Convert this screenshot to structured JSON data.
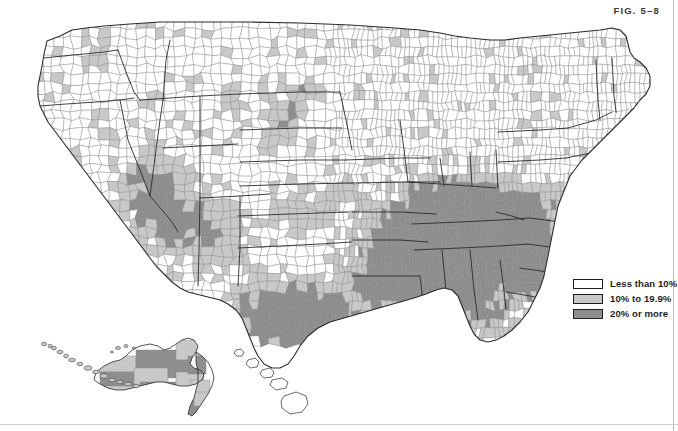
{
  "figure": {
    "label_prefix": "F",
    "label_small": "IG",
    "label_number": ". 5–8",
    "label_full": "FIG. 5–8",
    "clipped_top_text": ""
  },
  "legend": {
    "title": "",
    "items": [
      {
        "label": "Less than 10%",
        "color": "#ffffff",
        "swatch_name": "legend-swatch-less-than-10"
      },
      {
        "label": "10% to 19.9%",
        "color": "#c8c8c8",
        "swatch_name": "legend-swatch-10-to-19-9"
      },
      {
        "label": "20% or more",
        "color": "#8e8e8e",
        "swatch_name": "legend-swatch-20-or-more"
      }
    ]
  },
  "map": {
    "type": "choropleth",
    "geography": "united-states-counties",
    "insets": [
      "alaska",
      "hawaii"
    ],
    "colors": {
      "class_low": "#ffffff",
      "class_mid": "#c8c8c8",
      "class_high": "#8e8e8e",
      "county_outline": "#8a8a8a",
      "state_outline": "#2b2b2b",
      "background": "#ffffff"
    }
  },
  "chart_data": {
    "type": "map",
    "title": "FIG. 5–8",
    "subtitle": "",
    "map_kind": "choropleth",
    "unit": "county",
    "value_unit": "percent",
    "legend_position": "bottom-right",
    "classes": [
      {
        "label": "Less than 10%",
        "min": 0,
        "max": 10,
        "color": "#ffffff"
      },
      {
        "label": "10% to 19.9%",
        "min": 10,
        "max": 19.9,
        "color": "#c8c8c8"
      },
      {
        "label": "20% or more",
        "min": 20,
        "max": 100,
        "color": "#8e8e8e"
      }
    ],
    "regions": [
      {
        "name": "Northeast",
        "dominant_class": "Less than 10%"
      },
      {
        "name": "Upper Midwest",
        "dominant_class": "Less than 10%"
      },
      {
        "name": "Great Plains",
        "dominant_class": "Less than 10%"
      },
      {
        "name": "Mountain West",
        "dominant_class": "10% to 19.9%"
      },
      {
        "name": "Pacific Northwest",
        "dominant_class": "Less than 10%"
      },
      {
        "name": "Appalachia",
        "dominant_class": "20% or more"
      },
      {
        "name": "Deep South",
        "dominant_class": "20% or more"
      },
      {
        "name": "Mississippi Delta",
        "dominant_class": "20% or more"
      },
      {
        "name": "South Texas / Rio Grande",
        "dominant_class": "20% or more"
      },
      {
        "name": "Florida",
        "dominant_class": "10% to 19.9%"
      },
      {
        "name": "Alaska",
        "dominant_class": "10% to 19.9%"
      },
      {
        "name": "Hawaii",
        "dominant_class": "Less than 10%"
      }
    ]
  }
}
